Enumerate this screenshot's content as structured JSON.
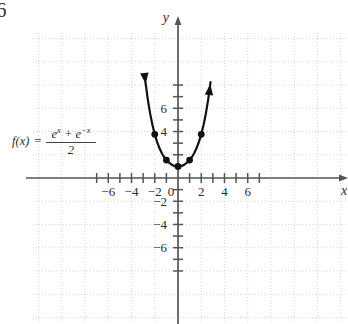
{
  "figure": {
    "corner_number": "6",
    "axis_labels": {
      "x": "x",
      "y": "y"
    },
    "formula": {
      "function_name": "f(x)",
      "equals": "=",
      "numerator_term1": "e",
      "numerator_exp1": "x",
      "numerator_plus": "+",
      "numerator_term2": "e",
      "numerator_exp2": "−x",
      "denominator": "2",
      "plain_text": "f(x) = (e^x + e^-x)/2"
    },
    "x_tick_labels": [
      "-6",
      "-4",
      "-2",
      "0",
      "2",
      "4",
      "6"
    ],
    "y_tick_labels": [
      "6",
      "4",
      "-2",
      "-4",
      "-6"
    ],
    "colors": {
      "curve": "#111111",
      "axis": "#555555",
      "grid": "#c9c9c9",
      "text": "#2e2e2e",
      "background": "#ffffff"
    }
  },
  "chart_data": {
    "type": "line",
    "title": "",
    "subtitle": "",
    "xlabel": "x",
    "ylabel": "y",
    "function": "f(x) = (e^x + e^(-x))/2",
    "function_alias": "cosh(x)",
    "xlim": [
      -7.8,
      7.8
    ],
    "ylim": [
      -8.2,
      8.2
    ],
    "xticks": [
      -7,
      -6,
      -5,
      -4,
      -3,
      -2,
      -1,
      0,
      1,
      2,
      3,
      4,
      5,
      6,
      7
    ],
    "yticks": [
      -8,
      -7,
      -6,
      -5,
      -4,
      -3,
      -2,
      -1,
      1,
      2,
      3,
      4,
      5,
      6,
      7,
      8
    ],
    "xtick_labels_shown": [
      -6,
      -4,
      -2,
      0,
      2,
      4,
      6
    ],
    "ytick_labels_shown": [
      6,
      4,
      -2,
      -4,
      -6
    ],
    "grid": true,
    "grid_style": "dotted",
    "grid_spacing_units": 2,
    "legend": "none",
    "curve_domain": [
      -2.78,
      2.78
    ],
    "arrowheads": [
      "start",
      "end"
    ],
    "x": [
      -2.8,
      -2.6,
      -2.4,
      -2.2,
      -2.0,
      -1.8,
      -1.6,
      -1.4,
      -1.2,
      -1.0,
      -0.8,
      -0.6,
      -0.4,
      -0.2,
      0.0,
      0.2,
      0.4,
      0.6,
      0.8,
      1.0,
      1.2,
      1.4,
      1.6,
      1.8,
      2.0,
      2.2,
      2.4,
      2.6,
      2.8
    ],
    "y": [
      8.25,
      6.77,
      5.56,
      4.57,
      3.76,
      3.11,
      2.58,
      2.15,
      1.81,
      1.54,
      1.34,
      1.19,
      1.08,
      1.02,
      1.0,
      1.02,
      1.08,
      1.19,
      1.34,
      1.54,
      1.81,
      2.15,
      2.58,
      3.11,
      3.76,
      4.57,
      5.56,
      6.77,
      8.25
    ],
    "marked_points": [
      {
        "x": -2,
        "y": 3.76
      },
      {
        "x": -1,
        "y": 1.54
      },
      {
        "x": 0,
        "y": 1.0
      },
      {
        "x": 1,
        "y": 1.54
      },
      {
        "x": 2,
        "y": 3.76
      }
    ]
  }
}
